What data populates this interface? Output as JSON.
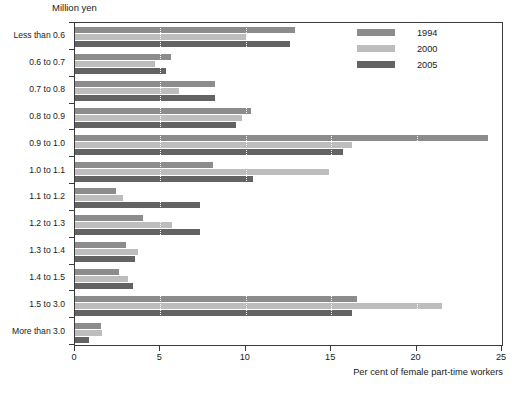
{
  "chart_data": {
    "type": "bar",
    "orientation": "horizontal",
    "title": "",
    "ylabel": "Million yen",
    "xlabel": "Per cent of female part-time workers",
    "xlim": [
      0,
      25
    ],
    "xticks": [
      0,
      5,
      10,
      15,
      20,
      25
    ],
    "gridlines": [
      5,
      10,
      15,
      20
    ],
    "grid": true,
    "grid_style": "dotted-white",
    "legend_position": "top-right",
    "categories": [
      "Less than 0.6",
      "0.6 to 0.7",
      "0.7 to 0.8",
      "0.8 to 0.9",
      "0.9 to 1.0",
      "1.0 to 1.1",
      "1.1 to 1.2",
      "1.2 to 1.3",
      "1.3 to 1.4",
      "1.4 to 1.5",
      "1.5 to 3.0",
      "More than 3.0"
    ],
    "series": [
      {
        "name": "1994",
        "color": "#8c8c8c",
        "values": [
          12.9,
          5.6,
          8.2,
          10.3,
          24.2,
          8.1,
          2.4,
          4.0,
          3.0,
          2.6,
          16.5,
          1.5
        ]
      },
      {
        "name": "2000",
        "color": "#bdbdbd",
        "values": [
          10.0,
          4.7,
          6.1,
          9.8,
          16.2,
          14.9,
          2.8,
          5.7,
          3.7,
          3.1,
          21.5,
          1.6
        ]
      },
      {
        "name": "2005",
        "color": "#636363",
        "values": [
          12.6,
          5.3,
          8.2,
          9.4,
          15.7,
          10.4,
          7.3,
          7.3,
          3.5,
          3.4,
          16.2,
          0.8
        ]
      }
    ]
  },
  "legend": {
    "entries": [
      {
        "label": "1994",
        "color": "#8c8c8c"
      },
      {
        "label": "2000",
        "color": "#bdbdbd"
      },
      {
        "label": "2005",
        "color": "#636363"
      }
    ]
  },
  "axes": {
    "y_unit_title": "Million yen",
    "x_axis_title": "Per cent of female part-time workers",
    "x_tick_labels": [
      "0",
      "5",
      "10",
      "15",
      "20",
      "25"
    ]
  }
}
